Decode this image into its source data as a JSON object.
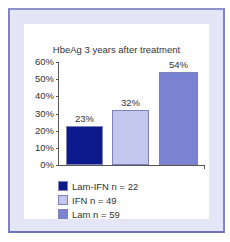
{
  "chart_data": {
    "type": "bar",
    "title": "HbeAg 3 years after treatment",
    "xlabel": "",
    "ylabel": "",
    "ylim": [
      0,
      60
    ],
    "yticks": [
      "60%",
      "50%",
      "40%",
      "30%",
      "20%",
      "10%",
      "0%"
    ],
    "categories": [
      "Lam-IFN n = 22",
      "IFN n = 49",
      "Lam n = 59"
    ],
    "values": [
      23,
      32,
      54
    ],
    "value_labels": [
      "23%",
      "32%",
      "54%"
    ],
    "colors": [
      "#0d1a8c",
      "#c3c7ee",
      "#7c82d2"
    ],
    "grid": false,
    "legend_position": "bottom-left"
  },
  "legend": [
    {
      "label": "Lam-IFN n = 22",
      "color": "#0d1a8c"
    },
    {
      "label": "IFN n = 49",
      "color": "#c3c7ee"
    },
    {
      "label": "Lam n = 59",
      "color": "#7c82d2"
    }
  ]
}
